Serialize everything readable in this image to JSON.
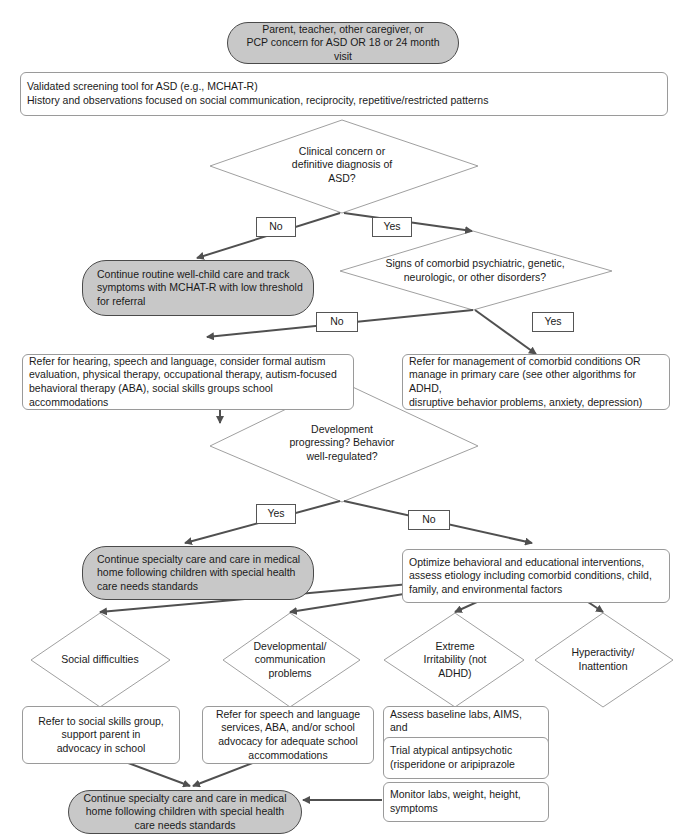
{
  "colors": {
    "terminal_fill": "#c8c8c8",
    "terminal_border": "#4a4a4a",
    "box_border": "#9a9a9a",
    "diamond_border": "#a0a0a0",
    "arrow": "#505050"
  },
  "start": {
    "lines": [
      "Parent, teacher, other caregiver, or",
      "PCP concern for ASD OR 18 or 24 month visit"
    ]
  },
  "screening": {
    "lines": [
      "Validated screening tool for ASD (e.g., MCHAT-R)",
      "History and observations focused on social communication, reciprocity, repetitive/restricted patterns"
    ]
  },
  "decision1": {
    "lines": [
      "Clinical concern or",
      "definitive diagnosis of",
      "ASD?"
    ],
    "no_label": "No",
    "yes_label": "Yes"
  },
  "routine_care": {
    "lines": [
      "Continue routine well-child care and track",
      "symptoms with MCHAT-R with low threshold",
      "for referral"
    ]
  },
  "decision2": {
    "lines": [
      "Signs of comorbid psychiatric, genetic,",
      "neurologic, or other disorders?"
    ],
    "no_label": "No",
    "yes_label": "Yes"
  },
  "refer_hearing": {
    "lines": [
      "Refer for hearing, speech and language, consider formal autism",
      "evaluation, physical therapy, occupational therapy, autism-focused",
      "behavioral therapy (ABA), social skills groups school accommodations"
    ]
  },
  "refer_comorbid": {
    "lines": [
      "Refer for management of comorbid conditions OR",
      "manage in primary care (see other algorithms for ADHD,",
      "disruptive behavior problems, anxiety, depression)"
    ]
  },
  "decision3": {
    "lines": [
      "Development",
      "progressing? Behavior",
      "well-regulated?"
    ],
    "yes_label": "Yes",
    "no_label": "No"
  },
  "specialty_care_1": {
    "lines": [
      "Continue specialty care and care in medical",
      "home following children with special health",
      "care needs standards"
    ]
  },
  "optimize": {
    "lines": [
      "Optimize behavioral and educational interventions,",
      "assess etiology including comorbid conditions, child,",
      "family, and environmental factors"
    ]
  },
  "branches": [
    {
      "id": "social",
      "lines": [
        "Social difficulties"
      ]
    },
    {
      "id": "developmental",
      "lines": [
        "Developmental/",
        "communication",
        "problems"
      ]
    },
    {
      "id": "irritability",
      "lines": [
        "Extreme",
        "Irritability (not",
        "ADHD)"
      ]
    },
    {
      "id": "hyperactivity",
      "lines": [
        "Hyperactivity/",
        "Inattention"
      ]
    }
  ],
  "social_action": {
    "lines": [
      "Refer to social skills group,",
      "support parent in",
      "advocacy in school"
    ]
  },
  "developmental_action": {
    "lines": [
      "Refer for speech and language",
      "services, ABA, and/or school",
      "advocacy for adequate school",
      "accommodations"
    ]
  },
  "irritability_actions": [
    {
      "lines": [
        "Assess baseline labs, AIMS, and",
        "growth parameters"
      ]
    },
    {
      "lines": [
        "Trial atypical antipsychotic",
        "(risperidone or aripiprazole"
      ]
    },
    {
      "lines": [
        "Monitor labs, weight, height,",
        "symptoms"
      ]
    }
  ],
  "specialty_care_2": {
    "lines": [
      "Continue specialty care and care in medical",
      "home following children with special health",
      "care needs standards"
    ]
  }
}
